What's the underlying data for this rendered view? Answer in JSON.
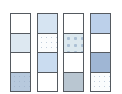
{
  "diagram": {
    "border_color": "#555a60",
    "columns": [
      {
        "id": "col-1",
        "left": 10,
        "cells": [
          {
            "fill": "#ffffff",
            "pattern": "none"
          },
          {
            "fill": "#dde8f1",
            "pattern": "none"
          },
          {
            "fill": "#ffffff",
            "pattern": "none"
          },
          {
            "fill": "#b7c9dd",
            "pattern": "dots"
          }
        ]
      },
      {
        "id": "col-2",
        "left": 37,
        "cells": [
          {
            "fill": "#d6e4f2",
            "pattern": "none"
          },
          {
            "fill": "#fbfcfd",
            "pattern": "dots"
          },
          {
            "fill": "#cadcf0",
            "pattern": "none"
          },
          {
            "fill": "#ffffff",
            "pattern": "none"
          }
        ]
      },
      {
        "id": "col-3",
        "left": 63,
        "cells": [
          {
            "fill": "#ffffff",
            "pattern": "none"
          },
          {
            "fill": "#dce8ee",
            "pattern": "bigdots"
          },
          {
            "fill": "#ffffff",
            "pattern": "none"
          },
          {
            "fill": "#b9c6d1",
            "pattern": "none"
          }
        ]
      },
      {
        "id": "col-4",
        "left": 90,
        "cells": [
          {
            "fill": "#bcd0ea",
            "pattern": "none"
          },
          {
            "fill": "#ffffff",
            "pattern": "none"
          },
          {
            "fill": "#9fb6d4",
            "pattern": "none"
          },
          {
            "fill": "#fafcfd",
            "pattern": "dots"
          }
        ]
      }
    ]
  }
}
